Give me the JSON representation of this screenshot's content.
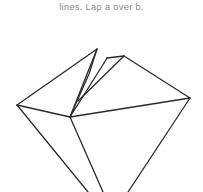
{
  "page": {
    "background_color": "#ffffff",
    "width": 203,
    "height": 192
  },
  "caption": {
    "text": "lines. Lap a over b.",
    "color": "#8a8a8a"
  },
  "figure": {
    "name": "origami-fold-step-diagram",
    "stroke_color": "#2b2b2b",
    "fill_color": "none",
    "stroke_width": 1.3,
    "vertices": {
      "left_point": [
        17,
        105
      ],
      "right_point": [
        190,
        98
      ],
      "center_hub": [
        70,
        117
      ],
      "top_left_peak": [
        97,
        49
      ],
      "flap_notch_left": [
        104,
        63
      ],
      "flap_notch_top": [
        107,
        58
      ],
      "right_peak": [
        124,
        56
      ],
      "bottom_converge": [
        103,
        192
      ],
      "bottom_left_tail": [
        88,
        192
      ],
      "bottom_right_tail": [
        128,
        192
      ]
    },
    "paths": [
      {
        "name": "upper-left-edge",
        "points": "17,105 97,49"
      },
      {
        "name": "left-peak-to-hub",
        "points": "97,49 70,117"
      },
      {
        "name": "inner-flap-left-fold",
        "points": "97,49 89,74 70,117"
      },
      {
        "name": "hub-to-notch",
        "points": "70,117 104,63"
      },
      {
        "name": "notch-top-short",
        "points": "104,63 107,58"
      },
      {
        "name": "notch-to-right-peak-inner",
        "points": "107,58 124,56"
      },
      {
        "name": "right-peak-left-edge",
        "points": "124,56 78,101"
      },
      {
        "name": "right-peak-to-right-point",
        "points": "124,56 190,98"
      },
      {
        "name": "hub-to-right-point",
        "points": "70,117 190,98"
      },
      {
        "name": "left-point-to-hub",
        "points": "17,105 70,117"
      },
      {
        "name": "left-point-lower-edge",
        "points": "17,105 88,192"
      },
      {
        "name": "hub-lower-left-edge",
        "points": "70,117 103,192"
      },
      {
        "name": "right-point-lower-edge",
        "points": "190,98 128,192"
      }
    ]
  }
}
